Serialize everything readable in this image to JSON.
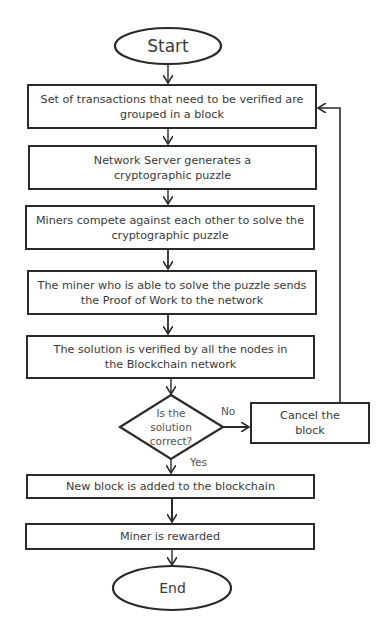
{
  "diagram": {
    "start": {
      "label": "Start"
    },
    "end": {
      "label": "End"
    },
    "steps": [
      {
        "id": "step-1",
        "text": "Set of transactions that need to be verified are grouped in a block"
      },
      {
        "id": "step-2",
        "text": "Network Server generates a cryptographic puzzle"
      },
      {
        "id": "step-3",
        "text": "Miners compete against each other to solve the cryptographic puzzle"
      },
      {
        "id": "step-4",
        "text": "The miner who is able to solve the puzzle sends the Proof of Work to the network"
      },
      {
        "id": "step-5",
        "text": "The solution is verified by all the nodes in the Blockchain network"
      },
      {
        "id": "step-6",
        "text": "New block is added to the blockchain"
      },
      {
        "id": "step-7",
        "text": "Miner is rewarded"
      }
    ],
    "decision": {
      "text": "Is the solution correct?",
      "yes_label": "Yes",
      "no_label": "No"
    },
    "cancel": {
      "text": "Cancel the block"
    },
    "colors": {
      "stroke": "#2a2a2a",
      "text": "#3a3a3a",
      "background": "#ffffff"
    }
  }
}
